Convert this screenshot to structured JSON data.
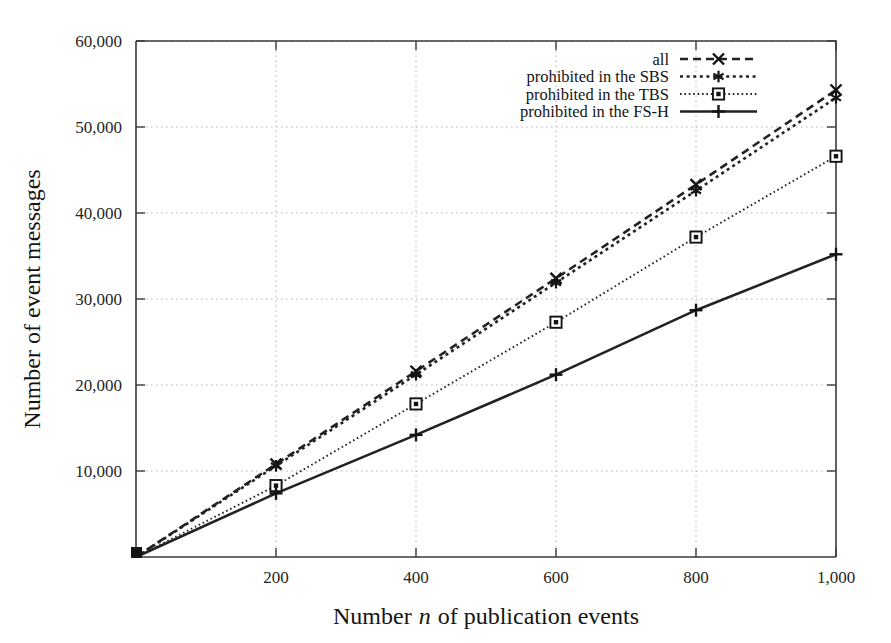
{
  "chart_data": {
    "type": "line",
    "title": "",
    "xlabel": "Number n of publication events",
    "xlabel_plain": "Number",
    "xlabel_italic": "n",
    "xlabel_tail": "of publication events",
    "ylabel": "Number of event messages",
    "xlim": [
      0,
      1000
    ],
    "ylim": [
      0,
      60000
    ],
    "grid": true,
    "legend_position": "top-right-inside",
    "x": [
      0,
      200,
      400,
      600,
      800,
      1000
    ],
    "xticks": [
      200,
      400,
      600,
      800,
      1000
    ],
    "xtick_labels": [
      "200",
      "400",
      "600",
      "800",
      "1,000"
    ],
    "yticks": [
      10000,
      20000,
      30000,
      40000,
      50000,
      60000
    ],
    "ytick_labels": [
      "10,000",
      "20,000",
      "30,000",
      "40,000",
      "50,000",
      "60,000"
    ],
    "series": [
      {
        "name": "all",
        "marker": "x-cross",
        "linestyle": "dashed",
        "color": "#222222",
        "values": [
          0,
          10800,
          21600,
          32400,
          43300,
          54300
        ]
      },
      {
        "name": "prohibited in the SBS",
        "marker": "star",
        "linestyle": "dotted",
        "color": "#222222",
        "values": [
          0,
          10600,
          21200,
          31900,
          42600,
          53400
        ]
      },
      {
        "name": "prohibited in the TBS",
        "marker": "open-square",
        "linestyle": "fine-dotted",
        "color": "#222222",
        "values": [
          0,
          8300,
          17800,
          27300,
          37200,
          46600
        ]
      },
      {
        "name": "prohibited in the FS-H",
        "marker": "plus",
        "linestyle": "solid",
        "color": "#222222",
        "values": [
          0,
          7400,
          14200,
          21200,
          28700,
          35200
        ]
      }
    ]
  },
  "legend": {
    "entries": [
      {
        "label": "all"
      },
      {
        "label": "prohibited in the SBS"
      },
      {
        "label": "prohibited in the TBS"
      },
      {
        "label": "prohibited in the FS-H"
      }
    ]
  }
}
